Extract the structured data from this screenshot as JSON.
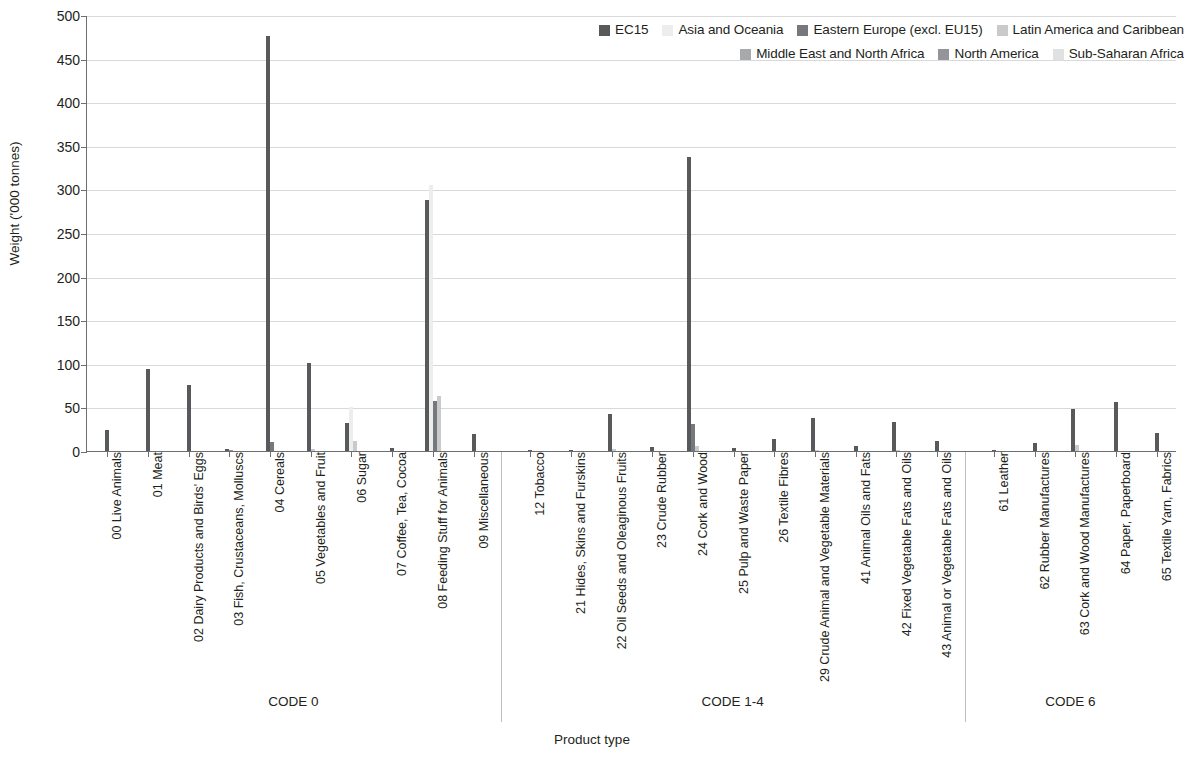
{
  "chart_data": {
    "type": "bar",
    "title": "",
    "xlabel": "Product type",
    "ylabel": "Weight ('000 tonnes)",
    "ylim": [
      0,
      500
    ],
    "yticks": [
      0,
      50,
      100,
      150,
      200,
      250,
      300,
      350,
      400,
      450,
      500
    ],
    "grid": true,
    "legend_position": "top-right",
    "series": [
      {
        "name": "EC15",
        "color": "#58595b"
      },
      {
        "name": "Asia and Oceania",
        "color": "#ededed"
      },
      {
        "name": "Eastern Europe (excl. EU15)",
        "color": "#77787b"
      },
      {
        "name": "Latin America and Caribbean",
        "color": "#c9cacc"
      },
      {
        "name": "Middle East and North Africa",
        "color": "#a7a9ac"
      },
      {
        "name": "North America",
        "color": "#939598"
      },
      {
        "name": "Sub-Saharan Africa",
        "color": "#e0e1e2"
      }
    ],
    "groups": [
      {
        "label": "CODE 0",
        "categories": [
          {
            "label": "00 Live Animals",
            "values": [
              24,
              0,
              0,
              0,
              0,
              0,
              0
            ]
          },
          {
            "label": "01 Meat",
            "values": [
              94,
              0,
              0,
              0,
              0,
              0,
              0
            ]
          },
          {
            "label": "02 Dairy Products and Birds' Eggs",
            "values": [
              76,
              0,
              0,
              0,
              0,
              0,
              0
            ]
          },
          {
            "label": "03 Fish, Crustaceans, Molluscs",
            "values": [
              2,
              0,
              0,
              0,
              0,
              1,
              0
            ]
          },
          {
            "label": "04 Cereals",
            "values": [
              476,
              0,
              10,
              0,
              0,
              0,
              0
            ]
          },
          {
            "label": "05 Vegetables and Fruit",
            "values": [
              101,
              0,
              0,
              2,
              0,
              0,
              0
            ]
          },
          {
            "label": "06 Sugar",
            "values": [
              32,
              51,
              0,
              12,
              0,
              0,
              0
            ]
          },
          {
            "label": "07 Coffee, Tea, Cocoa",
            "values": [
              3,
              0,
              0,
              0,
              0,
              0,
              0
            ]
          },
          {
            "label": "08 Feeding Stuff for Animals",
            "values": [
              288,
              305,
              57,
              63,
              0,
              0,
              0
            ]
          },
          {
            "label": "09 Miscellaneous",
            "values": [
              20,
              0,
              0,
              0,
              0,
              0,
              0
            ]
          }
        ]
      },
      {
        "label": "CODE 1-4",
        "categories": [
          {
            "label": "12 Tobacco",
            "values": [
              1,
              0,
              0,
              0,
              0,
              0,
              0
            ]
          },
          {
            "label": "21 Hides, Skins and Furskins",
            "values": [
              1,
              0,
              0,
              0,
              0,
              0,
              0
            ]
          },
          {
            "label": "22 Oil Seeds and Oleaginous Fruits",
            "values": [
              43,
              0,
              0,
              2,
              0,
              0,
              0
            ]
          },
          {
            "label": "23 Crude Rubber",
            "values": [
              5,
              0,
              0,
              0,
              0,
              0,
              0
            ]
          },
          {
            "label": "24 Cork and Wood",
            "values": [
              337,
              0,
              31,
              6,
              0,
              0,
              0
            ]
          },
          {
            "label": "25 Pulp and Waste Paper",
            "values": [
              4,
              0,
              0,
              0,
              0,
              0,
              0
            ]
          },
          {
            "label": "26 Textile Fibres",
            "values": [
              14,
              0,
              0,
              0,
              0,
              0,
              0
            ]
          },
          {
            "label": "29 Crude Animal and Vegetable Materials",
            "values": [
              38,
              0,
              0,
              1,
              0,
              0,
              0
            ]
          },
          {
            "label": "41 Animal Oils and Fats",
            "values": [
              6,
              0,
              0,
              0,
              0,
              0,
              0
            ]
          },
          {
            "label": "42 Fixed Vegetable Fats and Oils",
            "values": [
              33,
              0,
              0,
              1,
              0,
              0,
              0
            ]
          },
          {
            "label": "43 Animal or Vegetable Fats and Oils",
            "values": [
              11,
              0,
              0,
              0,
              0,
              0,
              0
            ]
          }
        ]
      },
      {
        "label": "CODE 6",
        "categories": [
          {
            "label": "61 Leather",
            "values": [
              1,
              0,
              0,
              0,
              0,
              0,
              0
            ]
          },
          {
            "label": "62 Rubber Manufactures",
            "values": [
              9,
              0,
              0,
              0,
              0,
              0,
              0
            ]
          },
          {
            "label": "63 Cork and Wood Manufactures",
            "values": [
              48,
              0,
              0,
              7,
              0,
              0,
              0
            ]
          },
          {
            "label": "64 Paper, Paperboard",
            "values": [
              56,
              0,
              0,
              0,
              0,
              0,
              0
            ]
          },
          {
            "label": "65 Textile Yarn, Fabrics",
            "values": [
              21,
              0,
              0,
              0,
              0,
              0,
              0
            ]
          }
        ]
      }
    ]
  },
  "legend": {
    "rows": [
      [
        {
          "label": "EC15",
          "color": "#58595b"
        },
        {
          "label": "Asia and Oceania",
          "color": "#ededed"
        },
        {
          "label": "Eastern Europe (excl. EU15)",
          "color": "#77787b"
        },
        {
          "label": "Latin America and Caribbean",
          "color": "#c9cacc"
        }
      ],
      [
        {
          "label": "Middle East and North Africa",
          "color": "#a7a9ac"
        },
        {
          "label": "North America",
          "color": "#939598"
        },
        {
          "label": "Sub-Saharan Africa",
          "color": "#e0e1e2"
        }
      ]
    ]
  }
}
